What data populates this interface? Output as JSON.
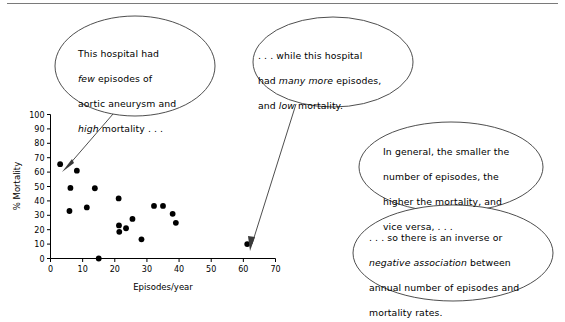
{
  "figure": {
    "name": "scatterplot-annotated",
    "background": "#ffffff",
    "line_color": "#3a3a3a",
    "point_color": "#000000"
  },
  "chart_data": {
    "type": "scatter",
    "title": "",
    "xlabel": "Episodes/year",
    "ylabel": "% Mortality",
    "xlim": [
      0,
      70
    ],
    "ylim": [
      0,
      100
    ],
    "xticks": [
      "0",
      "10",
      "20",
      "30",
      "40",
      "50",
      "60",
      "70"
    ],
    "yticks": [
      "0",
      "10",
      "20",
      "30",
      "40",
      "50",
      "60",
      "70",
      "80",
      "90",
      "100"
    ],
    "grid": false,
    "legend": "none",
    "series": [
      {
        "name": "Hospitals",
        "points": [
          {
            "x": 3.0,
            "y": 65.5
          },
          {
            "x": 6.2,
            "y": 49.0
          },
          {
            "x": 5.9,
            "y": 33.0
          },
          {
            "x": 8.2,
            "y": 61.0
          },
          {
            "x": 11.3,
            "y": 35.5
          },
          {
            "x": 13.8,
            "y": 48.8
          },
          {
            "x": 15.0,
            "y": 0.0
          },
          {
            "x": 21.2,
            "y": 41.7
          },
          {
            "x": 21.3,
            "y": 23.0
          },
          {
            "x": 21.4,
            "y": 18.5
          },
          {
            "x": 23.5,
            "y": 21.0
          },
          {
            "x": 25.5,
            "y": 27.5
          },
          {
            "x": 28.3,
            "y": 13.3
          },
          {
            "x": 32.2,
            "y": 36.5
          },
          {
            "x": 35.0,
            "y": 36.5
          },
          {
            "x": 38.0,
            "y": 31.0
          },
          {
            "x": 39.0,
            "y": 24.8
          },
          {
            "x": 61.2,
            "y": 10.0
          }
        ]
      }
    ]
  },
  "bubbles": [
    {
      "id": "bubble-low-volume-high-mortality",
      "line1": "This hospital had",
      "line2_pre": "",
      "line2_em": "few",
      "line2_post": " episodes of",
      "line3": "aortic aneurysm and",
      "line4_em": "high",
      "line4_post": " mortality . . ."
    },
    {
      "id": "bubble-high-volume-low-mortality",
      "line1": ". . . while this hospital",
      "line2_pre": "had ",
      "line2_em": "many more",
      "line2_post": " episodes,",
      "line3_pre": "and ",
      "line3_em": "low",
      "line3_post": " mortality."
    },
    {
      "id": "bubble-general-trend",
      "line1": "In general, the smaller the",
      "line2": "number of episodes, the",
      "line3": "higher the mortality, and",
      "line4": "vice versa, . . ."
    },
    {
      "id": "bubble-inverse-association",
      "line1": ". . . so there is an inverse or",
      "line2_em": "negative association",
      "line2_post": " between",
      "line3": "annual number of episodes and",
      "line4": "mortality rates."
    }
  ]
}
